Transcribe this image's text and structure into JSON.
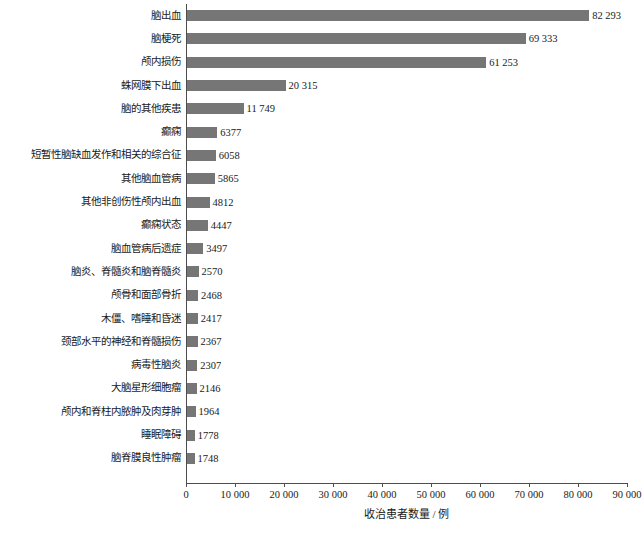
{
  "chart_data": {
    "type": "bar",
    "orientation": "horizontal",
    "title": "",
    "subtitle": "",
    "xlabel": "收治患者数量 / 例",
    "ylabel": "",
    "xlim": [
      0,
      90000
    ],
    "xticks": [
      0,
      10000,
      20000,
      30000,
      40000,
      50000,
      60000,
      70000,
      80000,
      90000
    ],
    "xtick_labels": [
      "0",
      "10 000",
      "20 000",
      "30 000",
      "40 000",
      "50 000",
      "60 000",
      "70 000",
      "80 000",
      "90 000"
    ],
    "grid": false,
    "legend": null,
    "bar_color": "#767676",
    "axis_color": "#4d4d4d",
    "categories": [
      "脑出血",
      "脑梗死",
      "颅内损伤",
      "蛛网膜下出血",
      "脑的其他疾患",
      "癫痫",
      "短暂性脑缺血发作和相关的综合征",
      "其他脑血管病",
      "其他非创伤性颅内出血",
      "癫痫状态",
      "脑血管病后遗症",
      "脑炎、脊髓炎和脑脊髓炎",
      "颅骨和面部骨折",
      "木僵、嗜睡和昏迷",
      "颈部水平的神经和脊髓损伤",
      "病毒性脑炎",
      "大脑星形细胞瘤",
      "颅内和脊柱内脓肿及肉芽肿",
      "睡眠障碍",
      "脑脊膜良性肿瘤"
    ],
    "values": [
      82293,
      69333,
      61253,
      20315,
      11749,
      6377,
      6058,
      5865,
      4812,
      4447,
      3497,
      2570,
      2468,
      2417,
      2367,
      2307,
      2146,
      1964,
      1778,
      1748
    ],
    "value_labels": [
      "82 293",
      "69 333",
      "61 253",
      "20 315",
      "11 749",
      "6377",
      "6058",
      "5865",
      "4812",
      "4447",
      "3497",
      "2570",
      "2468",
      "2417",
      "2367",
      "2307",
      "2146",
      "1964",
      "1778",
      "1748"
    ]
  }
}
